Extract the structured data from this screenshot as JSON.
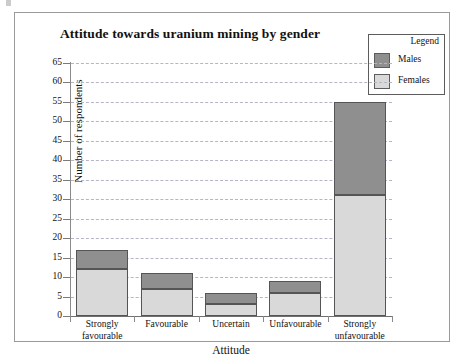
{
  "figure": {
    "title": "Attitude towards uranium mining by gender"
  },
  "legend": {
    "title": "Legend",
    "entries": [
      {
        "label": "Males",
        "color": "#8f8f8f",
        "swatch_name": "legend-swatch-males"
      },
      {
        "label": "Females",
        "color": "#d9d9d9",
        "swatch_name": "legend-swatch-females"
      }
    ]
  },
  "axes": {
    "y_label": "Number of respondents",
    "x_label": "Attitude",
    "y_ticks": [
      "0",
      "5",
      "10",
      "15",
      "20",
      "25",
      "30",
      "35",
      "40",
      "45",
      "50",
      "55",
      "60",
      "65"
    ]
  },
  "chart_data": {
    "type": "bar",
    "stacked": true,
    "title": "Attitude towards uranium mining by gender",
    "xlabel": "Attitude",
    "ylabel": "Number of respondents",
    "ylim": [
      0,
      65
    ],
    "ytick_step": 5,
    "grid": true,
    "legend_position": "top-right",
    "legend_title": "Legend",
    "categories": [
      "Strongly favourable",
      "Favourable",
      "Uncertain",
      "Unfavourable",
      "Strongly unfavourable"
    ],
    "category_lines": [
      [
        "Strongly",
        "favourable"
      ],
      [
        "Favourable"
      ],
      [
        "Uncertain"
      ],
      [
        "Unfavourable"
      ],
      [
        "Strongly",
        "unfavourable"
      ]
    ],
    "series": [
      {
        "name": "Females",
        "color": "#d9d9d9",
        "values": [
          12,
          7,
          3,
          6,
          31
        ]
      },
      {
        "name": "Males",
        "color": "#8f8f8f",
        "values": [
          5,
          4,
          3,
          3,
          24
        ]
      }
    ],
    "totals": [
      17,
      11,
      6,
      9,
      55
    ]
  }
}
